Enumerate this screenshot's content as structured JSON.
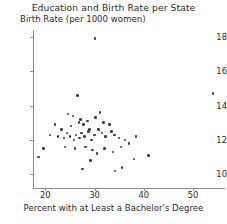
{
  "chart_data": {
    "type": "scatter",
    "title": "Education and Birth Rate per State",
    "xlabel": "Percent with at Least a Bachelor's Degree",
    "ylabel": "Birth Rate (per 1000 women)",
    "xlim": [
      17.5,
      56.5
    ],
    "ylim": [
      9.2,
      18.4
    ],
    "xticks": [
      20,
      30,
      40,
      50
    ],
    "yticks": [
      10,
      12,
      14,
      16,
      18
    ],
    "grid": false,
    "legend": null,
    "marker": "circle",
    "marker_color": "#3d3d3d",
    "points": [
      {
        "x": 19.6,
        "y": 11.5
      },
      {
        "x": 30.1,
        "y": 17.9
      },
      {
        "x": 26.5,
        "y": 14.6
      },
      {
        "x": 24.6,
        "y": 13.5
      },
      {
        "x": 25.6,
        "y": 13.4
      },
      {
        "x": 28.6,
        "y": 13.1
      },
      {
        "x": 22.0,
        "y": 12.9
      },
      {
        "x": 23.3,
        "y": 12.6
      },
      {
        "x": 25.2,
        "y": 12.8
      },
      {
        "x": 26.8,
        "y": 13.0
      },
      {
        "x": 27.1,
        "y": 13.2
      },
      {
        "x": 27.8,
        "y": 12.9
      },
      {
        "x": 29.0,
        "y": 12.6
      },
      {
        "x": 30.2,
        "y": 13.3
      },
      {
        "x": 31.1,
        "y": 13.6
      },
      {
        "x": 31.8,
        "y": 13.0
      },
      {
        "x": 33.0,
        "y": 12.9
      },
      {
        "x": 21.0,
        "y": 12.3
      },
      {
        "x": 22.6,
        "y": 12.2
      },
      {
        "x": 23.8,
        "y": 12.1
      },
      {
        "x": 24.4,
        "y": 12.4
      },
      {
        "x": 25.0,
        "y": 12.2
      },
      {
        "x": 25.8,
        "y": 12.0
      },
      {
        "x": 26.2,
        "y": 12.3
      },
      {
        "x": 26.9,
        "y": 12.1
      },
      {
        "x": 27.4,
        "y": 12.4
      },
      {
        "x": 28.0,
        "y": 12.2
      },
      {
        "x": 28.8,
        "y": 12.5
      },
      {
        "x": 29.4,
        "y": 12.0
      },
      {
        "x": 30.0,
        "y": 12.3
      },
      {
        "x": 30.8,
        "y": 12.6
      },
      {
        "x": 31.5,
        "y": 12.4
      },
      {
        "x": 32.2,
        "y": 12.2
      },
      {
        "x": 33.4,
        "y": 12.5
      },
      {
        "x": 34.1,
        "y": 12.3
      },
      {
        "x": 35.0,
        "y": 12.1
      },
      {
        "x": 36.2,
        "y": 12.0
      },
      {
        "x": 37.0,
        "y": 11.8
      },
      {
        "x": 38.4,
        "y": 12.2
      },
      {
        "x": 24.0,
        "y": 11.6
      },
      {
        "x": 26.0,
        "y": 11.5
      },
      {
        "x": 28.2,
        "y": 11.6
      },
      {
        "x": 29.6,
        "y": 11.4
      },
      {
        "x": 30.5,
        "y": 11.2
      },
      {
        "x": 32.0,
        "y": 11.5
      },
      {
        "x": 33.8,
        "y": 11.3
      },
      {
        "x": 35.4,
        "y": 11.6
      },
      {
        "x": 29.2,
        "y": 10.8
      },
      {
        "x": 18.6,
        "y": 11.0
      },
      {
        "x": 27.6,
        "y": 10.3
      },
      {
        "x": 34.2,
        "y": 10.2
      },
      {
        "x": 35.6,
        "y": 10.4
      },
      {
        "x": 38.0,
        "y": 10.9
      },
      {
        "x": 41.0,
        "y": 11.1
      },
      {
        "x": 54.1,
        "y": 14.7
      }
    ]
  }
}
